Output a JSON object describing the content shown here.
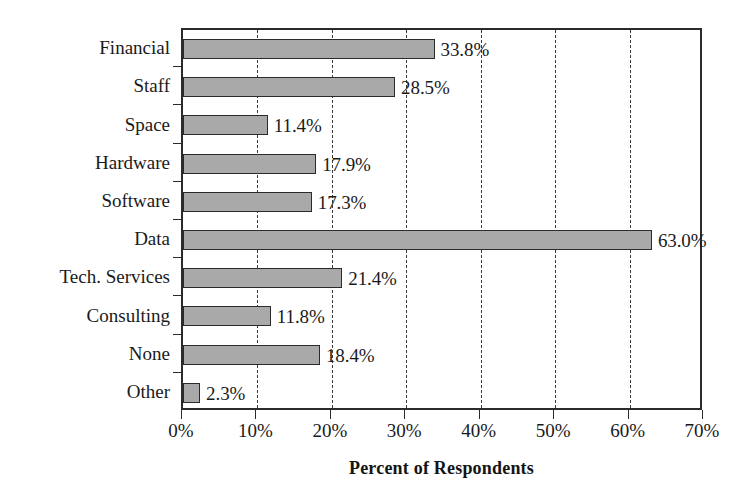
{
  "chart_data": {
    "type": "bar",
    "orientation": "horizontal",
    "title": "",
    "xlabel": "Percent of Respondents",
    "ylabel": "",
    "categories": [
      "Financial",
      "Staff",
      "Space",
      "Hardware",
      "Software",
      "Data",
      "Tech. Services",
      "Consulting",
      "None",
      "Other"
    ],
    "values": [
      33.8,
      28.5,
      11.4,
      17.9,
      17.3,
      63.0,
      21.4,
      11.8,
      18.4,
      2.3
    ],
    "data_labels": [
      "33.8%",
      "28.5%",
      "11.4%",
      "17.9%",
      "17.3%",
      "63.0%",
      "21.4%",
      "11.8%",
      "18.4%",
      "2.3%"
    ],
    "xlim": [
      0,
      70
    ],
    "xticks": [
      0,
      10,
      20,
      30,
      40,
      50,
      60,
      70
    ],
    "xtick_labels": [
      "0%",
      "10%",
      "20%",
      "30%",
      "40%",
      "50%",
      "60%",
      "70%"
    ],
    "grid": "vertical-dashed",
    "legend": "none",
    "colors": {
      "bar_fill": "#a9a9a9",
      "bar_border": "#2b2b2b",
      "axis": "#2b2b2b",
      "gridline": "#3a3a3a",
      "text": "#1a1a1a",
      "background": "#ffffff"
    }
  }
}
